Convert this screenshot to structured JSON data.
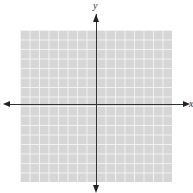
{
  "diagram": {
    "type": "coordinate-grid",
    "axes": {
      "x_label": "x",
      "y_label": "y"
    },
    "grid": {
      "columns": 16,
      "rows": 16,
      "background": "#d6d6d6",
      "line_color": "#f2f2f2"
    },
    "axis_color": "#333333"
  }
}
